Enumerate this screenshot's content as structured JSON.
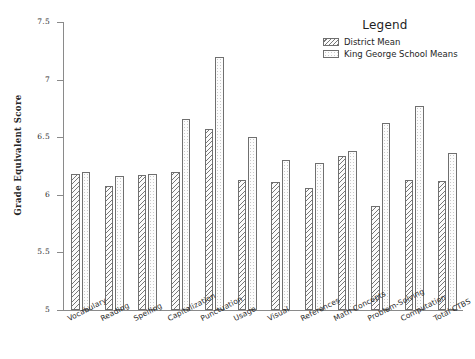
{
  "chart_data": {
    "type": "bar",
    "title": "",
    "subtitle": "",
    "xlabel": "",
    "ylabel": "Grade Equivalent Score",
    "ylim": [
      5,
      7.5
    ],
    "ytick_labels": [
      "7.5",
      "7",
      "6.5",
      "6",
      "5.5",
      "5"
    ],
    "yticks": [
      7.5,
      7,
      6.5,
      6,
      5.5,
      5
    ],
    "grid": false,
    "legend_position": "top-right",
    "legend_title": "Legend",
    "categories": [
      "Vocabulary",
      "Reading",
      "Spelling",
      "Capitalization",
      "Punctuation",
      "Usage",
      "Visual",
      "References",
      "Math Concepts",
      "Problem-Solving",
      "Computation",
      "Total CTBS"
    ],
    "series": [
      {
        "name": "District Mean",
        "pattern": "diagonal-hatch",
        "values": [
          6.18,
          6.08,
          6.17,
          6.2,
          6.57,
          6.13,
          6.11,
          6.06,
          6.34,
          5.9,
          6.13,
          6.12
        ]
      },
      {
        "name": "King George School Means",
        "pattern": "stipple",
        "values": [
          6.2,
          6.16,
          6.18,
          6.66,
          7.2,
          6.5,
          6.3,
          6.28,
          6.38,
          6.62,
          6.77,
          6.36
        ]
      }
    ]
  },
  "axes": {
    "y_title": "Grade Equivalent Score"
  },
  "legend": {
    "title": "Legend",
    "entries": [
      {
        "label": "District Mean"
      },
      {
        "label": "King George School Means"
      }
    ]
  },
  "colors": {
    "axis": "#8a8a8a",
    "bar_outline": "#6f6f6f",
    "text": "#1e1e1e",
    "background": "#ffffff"
  }
}
